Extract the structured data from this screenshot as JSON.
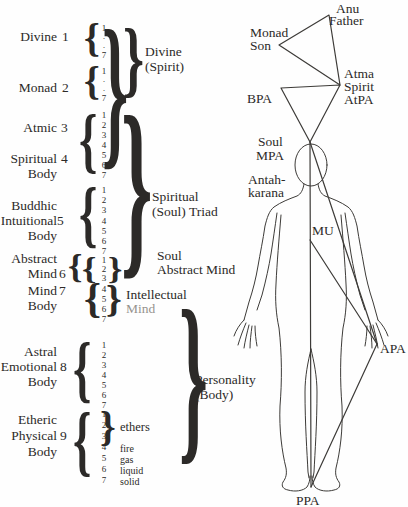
{
  "colors": {
    "text": "#2c2a28",
    "line": "#3d3b38",
    "muted": "#96938e",
    "background": "#fefefe"
  },
  "left_column": {
    "planes": [
      {
        "name_lines": [
          "Divine"
        ],
        "number": "1"
      },
      {
        "name_lines": [
          "Monad"
        ],
        "number": "2"
      },
      {
        "name_lines": [
          "Atmic"
        ],
        "number": "3"
      },
      {
        "name_lines": [
          "Spiritual",
          "Body"
        ],
        "number": "4"
      },
      {
        "name_lines": [
          "Buddhic",
          "Intuitional",
          "Body"
        ],
        "number": "5"
      },
      {
        "name_lines": [
          "Abstract",
          "Mind"
        ],
        "number": "6"
      },
      {
        "name_lines": [
          "Mind",
          "Body"
        ],
        "number": "7"
      },
      {
        "name_lines": [
          "Astral",
          "Emotional",
          "Body"
        ],
        "number": "8"
      },
      {
        "name_lines": [
          "Etheric",
          "Physical",
          "Body"
        ],
        "number": "9"
      }
    ],
    "subplane_groups": [
      [
        "1",
        "·",
        "·",
        "7"
      ],
      [
        "1",
        "·",
        "·",
        "7"
      ],
      [
        "1",
        "2",
        "3",
        "4",
        "5",
        "6",
        "7"
      ],
      [
        "1",
        "2",
        "3",
        "4",
        "5",
        "6",
        "7"
      ],
      [
        "1",
        "2",
        "3"
      ],
      [
        "4",
        "5",
        "6",
        "7"
      ],
      [
        "1",
        "2",
        "3",
        "4",
        "5",
        "6",
        "7"
      ],
      [
        "1",
        "2",
        "3",
        "4",
        "5",
        "6",
        "7"
      ]
    ],
    "group_labels": {
      "divine_spirit": [
        "Divine",
        "(Spirit)"
      ],
      "spiritual_triad": [
        "Spiritual",
        "(Soul) Triad"
      ],
      "soul_abstract": [
        "Soul",
        "Abstract Mind"
      ],
      "intellectual_mind": [
        "Intellectual",
        "Mind"
      ],
      "personality": [
        "Personality",
        "(Body)"
      ],
      "ethers": "ethers",
      "physical_states": [
        "fire",
        "gas",
        "liquid",
        "solid"
      ]
    }
  },
  "figure": {
    "labels": {
      "anu": "Anu",
      "father": "Father",
      "monad": "Monad",
      "son": "Son",
      "atma": "Atma",
      "spirit": "Spirit",
      "atpa": "AtPA",
      "bpa": "BPA",
      "soul": "Soul",
      "mpa": "MPA",
      "antah": "Antah-",
      "karana": "karana",
      "mu": "MU",
      "apa": "APA",
      "ppa": "PPA"
    }
  }
}
